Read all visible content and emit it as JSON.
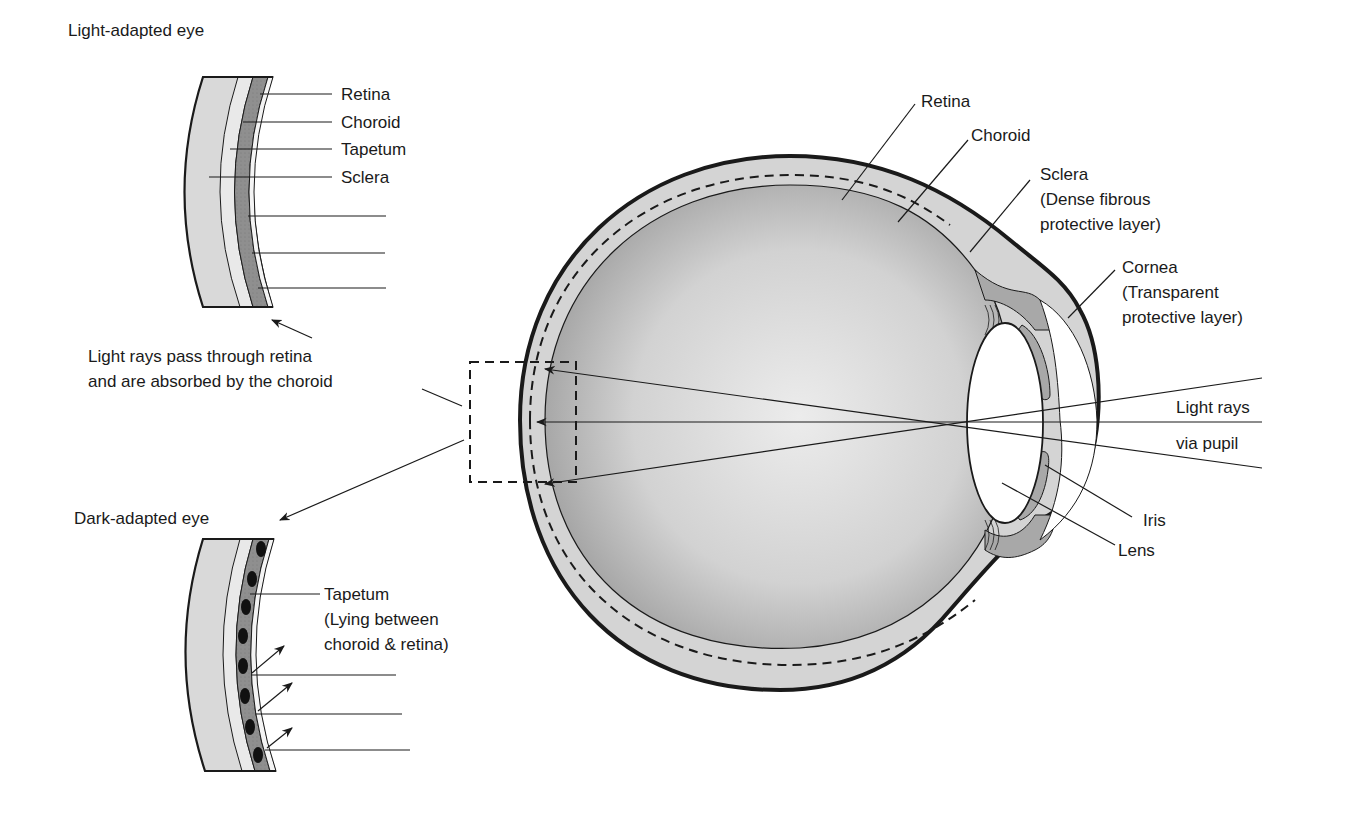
{
  "figure": {
    "colors": {
      "sclera": "#d9d9d9",
      "tapetum_light": "#e6e6e6",
      "choroid": "#9a9a9a",
      "retina": "#f2f2f2",
      "outline": "#1a1a1a",
      "background": "#ffffff",
      "iris": "#a8a8a8"
    }
  },
  "light_adapted": {
    "title": "Light-adapted eye",
    "labels": {
      "retina": "Retina",
      "choroid": "Choroid",
      "tapetum": "Tapetum",
      "sclera": "Sclera"
    },
    "caption_line1": "Light rays pass through retina",
    "caption_line2": "and are absorbed by the choroid"
  },
  "dark_adapted": {
    "title": "Dark-adapted eye",
    "tapetum_label": "Tapetum",
    "tapetum_note_line1": "(Lying between",
    "tapetum_note_line2": "choroid & retina)"
  },
  "main_eye": {
    "labels": {
      "retina": "Retina",
      "choroid": "Choroid",
      "sclera": "Sclera",
      "sclera_note_line1": "(Dense fibrous",
      "sclera_note_line2": "protective layer)",
      "cornea": "Cornea",
      "cornea_note_line1": "(Transparent",
      "cornea_note_line2": "protective layer)",
      "light_rays_line1": "Light rays",
      "light_rays_line2": "via pupil",
      "iris": "Iris",
      "lens": "Lens"
    }
  }
}
